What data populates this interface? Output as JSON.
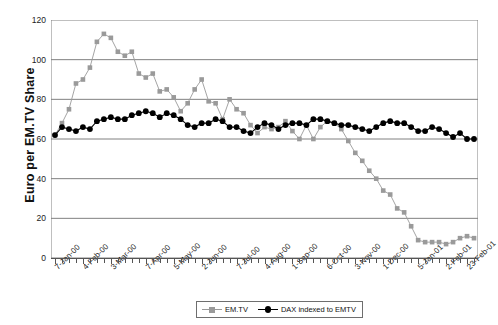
{
  "chart_data": {
    "type": "line",
    "title": "",
    "xlabel": "",
    "ylabel": "Euro per EM.TV Share",
    "ylim": [
      0,
      120
    ],
    "yticks": [
      0,
      20,
      40,
      60,
      80,
      100,
      120
    ],
    "grid": "horizontal",
    "legend_position": "bottom-center",
    "xtick_labels": [
      "7-Jan-00",
      "4-Feb-00",
      "3-Mar-00",
      "7-Apr-00",
      "5-May-00",
      "2-Jun-00",
      "7-Jul-00",
      "4-Aug-00",
      "1-Sep-00",
      "6-Oct-00",
      "3-Nov-00",
      "1-Dec-00",
      "5-Jan-01",
      "2-Feb-01",
      "23-Feb-01"
    ],
    "xtick_indices": [
      0,
      4,
      8,
      13,
      17,
      21,
      26,
      30,
      34,
      39,
      43,
      47,
      52,
      56,
      59
    ],
    "n_points": 61,
    "series": [
      {
        "name": "EM.TV",
        "color": "#9a9a9a",
        "marker": "square",
        "values": [
          62,
          68,
          75,
          88,
          90,
          96,
          109,
          113,
          111,
          104,
          102,
          104,
          93,
          91,
          93,
          84,
          85,
          81,
          74,
          78,
          85,
          90,
          79,
          78,
          70,
          80,
          75,
          73,
          67,
          63,
          66,
          65,
          66,
          69,
          64,
          60,
          67,
          60,
          66,
          69,
          68,
          65,
          59,
          53,
          49,
          44,
          40,
          34,
          32,
          25,
          23,
          16,
          9,
          8,
          8,
          8,
          7,
          8,
          10,
          11,
          10
        ]
      },
      {
        "name": "DAX indexed to EMTV",
        "color": "#000000",
        "marker": "circle",
        "values": [
          62,
          66,
          65,
          64,
          66,
          65,
          69,
          70,
          71,
          70,
          70,
          72,
          73,
          74,
          73,
          71,
          73,
          72,
          70,
          67,
          66,
          68,
          68,
          70,
          69,
          66,
          66,
          64,
          63,
          66,
          68,
          67,
          65,
          67,
          68,
          68,
          67,
          70,
          70,
          69,
          68,
          67,
          67,
          66,
          65,
          64,
          66,
          68,
          69,
          68,
          68,
          66,
          64,
          64,
          66,
          65,
          63,
          61,
          63,
          60,
          60
        ]
      }
    ]
  },
  "legend": {
    "items": [
      {
        "label": "EM.TV"
      },
      {
        "label": "DAX indexed to EMTV"
      }
    ]
  },
  "axis": {
    "y_title": "Euro per EM.TV Share"
  }
}
